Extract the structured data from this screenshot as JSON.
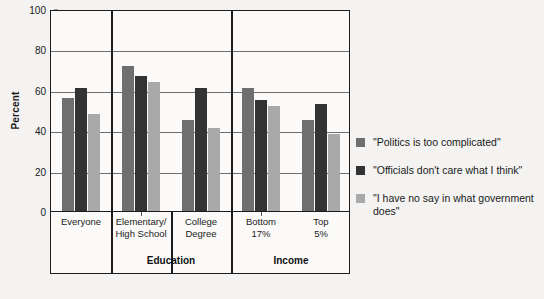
{
  "chart_data": {
    "type": "bar",
    "title": "",
    "xlabel": "",
    "ylabel": "Percent",
    "ylim": [
      0,
      100
    ],
    "yticks": [
      0,
      20,
      40,
      60,
      80,
      100
    ],
    "grid": true,
    "legend_position": "right",
    "categories": [
      "Everyone",
      "Elementary/\nHigh School",
      "College\nDegree",
      "Bottom\n17%",
      "Top\n5%"
    ],
    "category_labels": [
      {
        "line1": "Everyone",
        "line2": ""
      },
      {
        "line1": "Elementary/",
        "line2": "High School"
      },
      {
        "line1": "College",
        "line2": "Degree"
      },
      {
        "line1": "Bottom",
        "line2": "17%"
      },
      {
        "line1": "Top",
        "line2": "5%"
      }
    ],
    "supergroups": [
      {
        "label": "",
        "span": 1
      },
      {
        "label": "Education",
        "span": 2
      },
      {
        "label": "Income",
        "span": 2
      }
    ],
    "series": [
      {
        "name": "\"Politics is too complicated\"",
        "color": "#6f6f6f",
        "values": [
          56,
          72,
          45,
          61,
          45
        ]
      },
      {
        "name": "\"Officials don't care what I think\"",
        "color": "#333333",
        "values": [
          61,
          67,
          61,
          55,
          53
        ]
      },
      {
        "name": "\"I have no say in what government does\"",
        "color": "#a9a9a9",
        "values": [
          48,
          64,
          41,
          52,
          38
        ]
      }
    ]
  },
  "legend": {
    "entries": [
      {
        "label": "\"Politics is too complicated\"",
        "swatch": "#6f6f6f"
      },
      {
        "label": "\"Officials don't care what I think\"",
        "swatch": "#333333"
      },
      {
        "label": "\"I have no say in what government does\"",
        "swatch": "#a9a9a9"
      }
    ]
  },
  "axis": {
    "y_title": "Percent",
    "y_tick_labels": [
      "100",
      "80",
      "60",
      "40",
      "20",
      "0"
    ]
  },
  "groups": {
    "education_label": "Education",
    "income_label": "Income"
  }
}
